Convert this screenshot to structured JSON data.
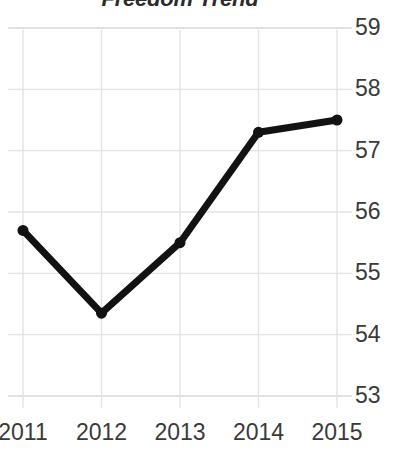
{
  "chart_data": {
    "type": "line",
    "title": "Freedom Trend",
    "xlabel": "",
    "ylabel": "",
    "categories": [
      "2011",
      "2012",
      "2013",
      "2014",
      "2015"
    ],
    "x": [
      2011,
      2012,
      2013,
      2014,
      2015
    ],
    "values": [
      55.7,
      54.35,
      55.5,
      57.3,
      57.5
    ],
    "series": [
      {
        "name": "Freedom Trend",
        "values": [
          55.7,
          54.35,
          55.5,
          57.3,
          57.5
        ]
      }
    ],
    "ylim": [
      53,
      59
    ],
    "xlim": [
      2011,
      2015
    ],
    "y_ticks": [
      59,
      58,
      57,
      56,
      55,
      54,
      53
    ],
    "y_tick_labels": [
      "59",
      "58",
      "57",
      "56",
      "55",
      "54",
      "53"
    ],
    "x_ticks": [
      2011,
      2012,
      2013,
      2014,
      2015
    ],
    "x_tick_labels": [
      "2011",
      "2012",
      "2013",
      "2014",
      "2015"
    ],
    "y_axis_position": "right",
    "grid": true,
    "legend": false,
    "legend_position": "none",
    "line_color": "#121212",
    "line_width": 7,
    "marker": "circle",
    "marker_size": 11,
    "grid_color": "#e3e3e3",
    "axis_color": "#d7d7d7",
    "tick_label_color": "#3a3a3a",
    "title_color": "#2b2b2b",
    "background": "#ffffff"
  }
}
